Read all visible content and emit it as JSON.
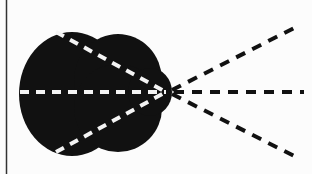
{
  "diagram": {
    "type": "ray-diagram",
    "colors": {
      "background": "#fcfcfc",
      "body": "#111111",
      "inner_rays": "#f4f4f4",
      "outer_rays": "#111111",
      "border": "#333333"
    },
    "focal_point": {
      "x": 168,
      "y": 92
    },
    "inner_rays": [
      {
        "from": [
          56,
          32
        ],
        "to": [
          166,
          92
        ]
      },
      {
        "from": [
          20,
          92
        ],
        "to": [
          166,
          92
        ]
      },
      {
        "from": [
          56,
          152
        ],
        "to": [
          166,
          92
        ]
      }
    ],
    "outer_rays": [
      {
        "from": [
          172,
          90
        ],
        "to": [
          298,
          26
        ]
      },
      {
        "from": [
          174,
          92
        ],
        "to": [
          304,
          92
        ]
      },
      {
        "from": [
          172,
          94
        ],
        "to": [
          298,
          158
        ]
      }
    ]
  }
}
